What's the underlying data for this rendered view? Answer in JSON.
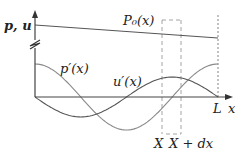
{
  "diagram": {
    "axes": {
      "y_label": "p, u",
      "x_label": "x",
      "x_end_label": "L"
    },
    "curves": [
      {
        "name": "P0",
        "label": "P₀(x)",
        "kind": "linear-decreasing",
        "color": "#555555"
      },
      {
        "name": "p_prime",
        "label": "p′(x)",
        "kind": "cosine",
        "color": "#8a8a8a"
      },
      {
        "name": "u_prime",
        "label": "u′(x)",
        "kind": "negative-sine",
        "color": "#555555"
      }
    ],
    "element": {
      "left_label": "X",
      "right_label": "X + dx",
      "style": "dashed"
    },
    "axis_break": true
  }
}
